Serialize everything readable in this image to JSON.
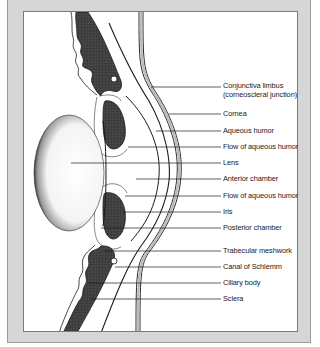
{
  "caption": "circulation.",
  "diagram": {
    "labels": [
      {
        "id": "conjunctiva-limbus",
        "text": "Conjunctiva limbus",
        "text2": "(corneoscleral junction)",
        "y": 90
      },
      {
        "id": "cornea",
        "text": "Cornea",
        "y": 113
      },
      {
        "id": "aqueous-humor",
        "text": "Aqueous humor",
        "y": 130
      },
      {
        "id": "flow-aqueous-humor-1",
        "text": "Flow of aqueous humor",
        "y": 146
      },
      {
        "id": "lens",
        "text": "Lens",
        "y": 162
      },
      {
        "id": "anterior-chamber",
        "text": "Anterior chamber",
        "y": 178
      },
      {
        "id": "flow-aqueous-humor-2",
        "text": "Flow of aqueous humor",
        "y": 195
      },
      {
        "id": "iris",
        "text": "Iris",
        "y": 211
      },
      {
        "id": "posterior-chamber",
        "text": "Posterior chamber",
        "y": 227
      },
      {
        "id": "trabecular-meshwork",
        "text": "Trabecular meshwork",
        "y": 250
      },
      {
        "id": "canal-of-schlemm",
        "text": "Canal of Schlemm",
        "y": 266
      },
      {
        "id": "ciliary-body",
        "text": "Ciliary body",
        "y": 282
      },
      {
        "id": "sclera",
        "text": "Sclera",
        "y": 298
      }
    ]
  },
  "colors": {
    "panel": "#d6d6d6",
    "figure_bg": "#ffffff",
    "ink": "#1a1a1a",
    "tissue_dark": "#3a3a3a"
  }
}
